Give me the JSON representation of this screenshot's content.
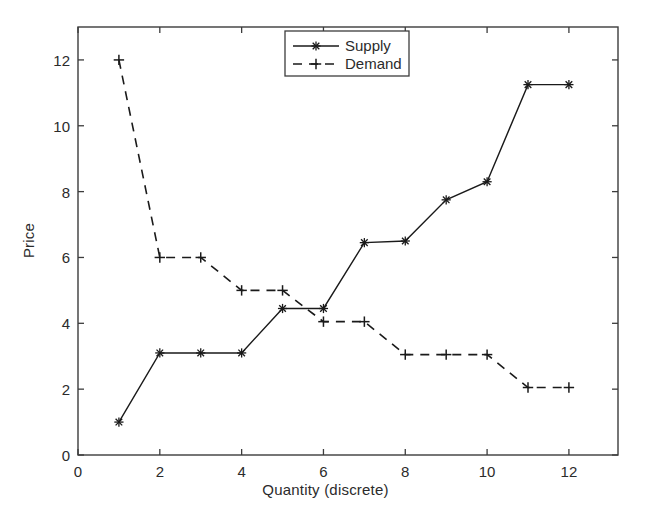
{
  "chart_data": {
    "type": "line",
    "title": "",
    "subtitle": "",
    "xlabel": "Quantity (discrete)",
    "ylabel": "Price",
    "x": [
      1,
      2,
      3,
      4,
      5,
      6,
      7,
      8,
      9,
      10,
      11,
      12
    ],
    "categories": [
      "1",
      "2",
      "3",
      "4",
      "5",
      "6",
      "7",
      "8",
      "9",
      "10",
      "11",
      "12"
    ],
    "series": [
      {
        "name": "Supply",
        "values": [
          1.0,
          3.1,
          3.1,
          3.1,
          4.45,
          4.45,
          6.45,
          6.5,
          7.75,
          8.3,
          11.25,
          11.25
        ],
        "linestyle": "solid",
        "marker": "asterisk",
        "color": "#1a1a1a"
      },
      {
        "name": "Demand",
        "values": [
          12.0,
          6.0,
          6.0,
          5.0,
          5.0,
          4.05,
          4.05,
          3.05,
          3.05,
          3.05,
          2.05,
          2.05
        ],
        "linestyle": "dashed",
        "marker": "plus",
        "color": "#1a1a1a"
      }
    ],
    "xlim": [
      0,
      13.2
    ],
    "ylim": [
      0,
      13.0
    ],
    "xticks": [
      0,
      2,
      4,
      6,
      8,
      10,
      12
    ],
    "xticklabels": [
      "0",
      "2",
      "4",
      "6",
      "8",
      "10",
      "12"
    ],
    "yticks": [
      0,
      2,
      4,
      6,
      8,
      10,
      12
    ],
    "yticklabels": [
      "0",
      "2",
      "4",
      "6",
      "8",
      "10",
      "12"
    ],
    "grid": false,
    "legend": {
      "position": "upper center",
      "boxed": true,
      "entries": [
        "Supply",
        "Demand"
      ]
    },
    "background": "#ffffff",
    "axis_color": "#3c3c3c"
  }
}
